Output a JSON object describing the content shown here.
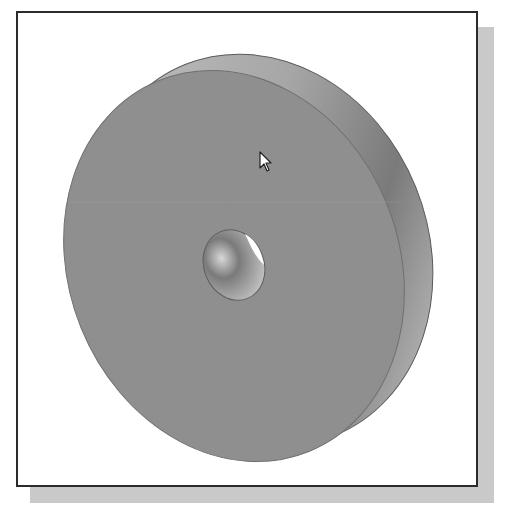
{
  "figure": {
    "caption": "",
    "model": {
      "type": "washer",
      "face_color": "#8c8c8c",
      "rim_color": "#b4b4b4",
      "rim_dark_color": "#6f6f6f",
      "hole_highlight_color": "#ffffff"
    },
    "cursor": {
      "icon": "mouse-pointer-arrow",
      "x": 258,
      "y": 150
    },
    "frame": {
      "border_color": "#2b2b2b",
      "shadow_color": "#c9c9c9"
    }
  }
}
